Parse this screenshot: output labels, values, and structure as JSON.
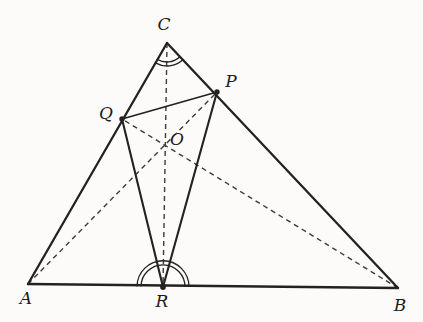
{
  "figure": {
    "width": 423,
    "height": 322,
    "background_color": "#fcfbf9",
    "stroke_color": "#222222",
    "dashed_color": "#3b3b3b",
    "dash_pattern": "5 4",
    "points": {
      "A": {
        "x": 28,
        "y": 284
      },
      "B": {
        "x": 398,
        "y": 288
      },
      "C": {
        "x": 167,
        "y": 43
      },
      "P": {
        "x": 217,
        "y": 92
      },
      "Q": {
        "x": 122,
        "y": 119
      },
      "R": {
        "x": 163,
        "y": 287
      },
      "O": {
        "x": 165,
        "y": 145
      }
    },
    "labels": {
      "A": {
        "text": "A",
        "x": 26,
        "y": 304
      },
      "B": {
        "text": "B",
        "x": 400,
        "y": 311
      },
      "C": {
        "text": "C",
        "x": 164,
        "y": 30
      },
      "P": {
        "text": "P",
        "x": 231,
        "y": 87
      },
      "Q": {
        "text": "Q",
        "x": 106,
        "y": 119
      },
      "O": {
        "text": "O",
        "x": 177,
        "y": 145
      },
      "R": {
        "text": "R",
        "x": 162,
        "y": 307
      }
    },
    "solid_edges": [
      {
        "from": "A",
        "to": "B",
        "width": 2.3
      },
      {
        "from": "A",
        "to": "C",
        "width": 2.3
      },
      {
        "from": "C",
        "to": "B",
        "width": 2.3
      },
      {
        "from": "Q",
        "to": "P",
        "width": 1.8
      },
      {
        "from": "Q",
        "to": "R",
        "width": 2.1
      },
      {
        "from": "P",
        "to": "R",
        "width": 2.1
      }
    ],
    "dashed_edges": [
      {
        "from": "C",
        "to": "R",
        "width": 1.4
      },
      {
        "from": "A",
        "to": "P",
        "width": 1.4
      },
      {
        "from": "B",
        "to": "Q",
        "width": 1.4
      }
    ],
    "dots": [
      {
        "at": "P",
        "r": 2.7
      },
      {
        "at": "Q",
        "r": 2.7
      },
      {
        "at": "R",
        "r": 2.9
      }
    ],
    "angle_marks": [
      {
        "at": "C",
        "from": "A",
        "to": "B",
        "radii": [
          19,
          23
        ],
        "sweep": 0,
        "width": 1.3
      },
      {
        "at": "R",
        "from": "A",
        "to": "B",
        "radii": [
          22,
          26
        ],
        "sweep": 1,
        "width": 1.3
      }
    ]
  }
}
